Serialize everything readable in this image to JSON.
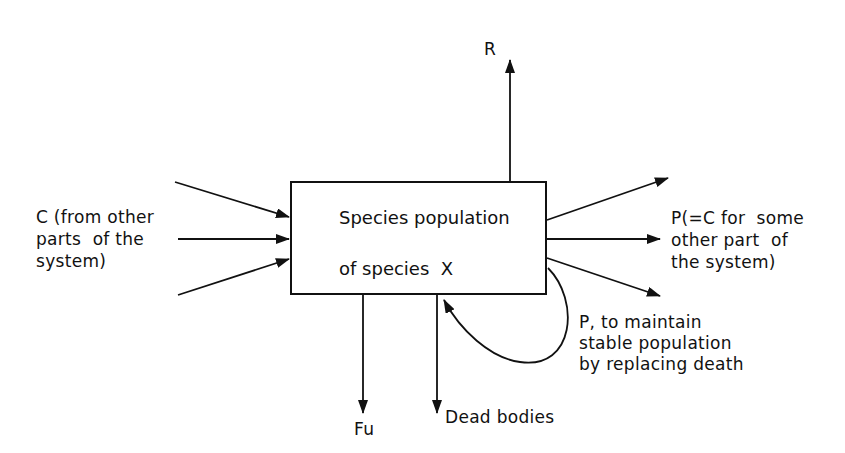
{
  "diagram": {
    "type": "energy-flow-box-diagram",
    "central_box": {
      "line1": "Species population",
      "line2": "of species  X"
    },
    "inputs": {
      "label_lines": [
        "C (from other",
        "parts  of the",
        "system)"
      ],
      "arrow_count": 3
    },
    "outputs": {
      "respiration": {
        "label": "R"
      },
      "production": {
        "label_lines": [
          "P(=C for  some",
          "other part  of",
          "the system)"
        ],
        "arrow_count": 3
      },
      "feces": {
        "label": "Fu"
      },
      "dead_bodies": {
        "label": "Dead bodies"
      },
      "replacement_loop": {
        "label_lines": [
          "P, to maintain",
          "stable population",
          "by replacing death"
        ]
      }
    },
    "colors": {
      "line": "#111111",
      "background": "#ffffff"
    }
  }
}
